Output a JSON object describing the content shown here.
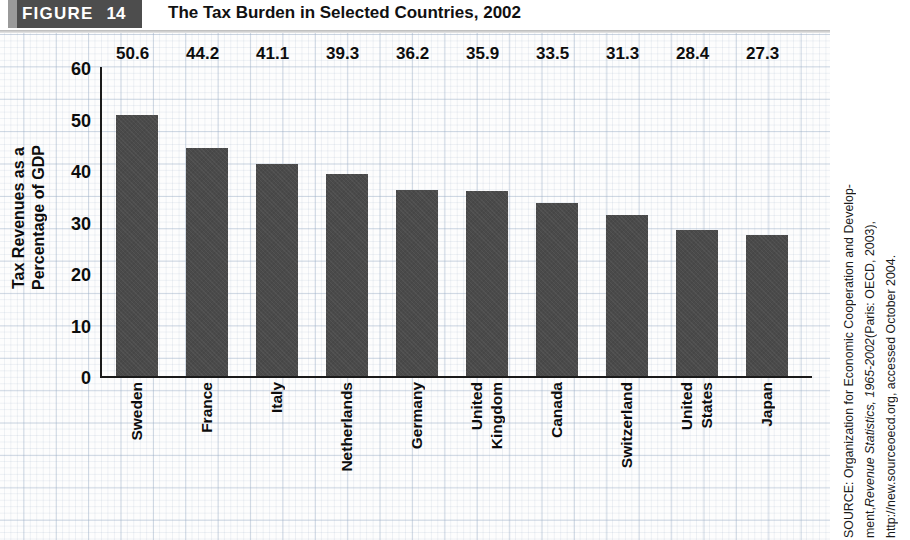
{
  "header": {
    "figure_word": "FIGURE",
    "figure_number": "14",
    "title": "The Tax Burden in Selected Countries, 2002"
  },
  "chart_data": {
    "type": "bar",
    "title": "The Tax Burden in Selected Countries, 2002",
    "xlabel": "",
    "ylabel": "Tax Revenues as a Percentage of GDP",
    "ylabel_lines": [
      "Tax Revenues as a",
      "Percentage of GDP"
    ],
    "ylim": [
      0,
      60
    ],
    "yticks": [
      "60",
      "50",
      "40",
      "30",
      "20",
      "10",
      "0"
    ],
    "ytick_values": [
      60,
      50,
      40,
      30,
      20,
      10,
      0
    ],
    "grid": true,
    "legend": "none",
    "bar_color": "#4a4a4a",
    "categories": [
      "Sweden",
      "France",
      "Italy",
      "Netherlands",
      "Germany",
      "United Kingdom",
      "Canada",
      "Switzerland",
      "United States",
      "Japan"
    ],
    "category_label_lines": [
      [
        "Sweden"
      ],
      [
        "France"
      ],
      [
        "Italy"
      ],
      [
        "Netherlands"
      ],
      [
        "Germany"
      ],
      [
        "United",
        "Kingdom"
      ],
      [
        "Canada"
      ],
      [
        "Switzerland"
      ],
      [
        "United",
        "States"
      ],
      [
        "Japan"
      ]
    ],
    "values": [
      50.6,
      44.2,
      41.1,
      39.3,
      36.2,
      35.9,
      33.5,
      31.3,
      28.4,
      27.3
    ],
    "value_labels": [
      "50.6",
      "44.2",
      "41.1",
      "39.3",
      "36.2",
      "35.9",
      "33.5",
      "31.3",
      "28.4",
      "27.3"
    ]
  },
  "source": {
    "line1": "SOURCE: Organization for Economic Cooperation and Develop-",
    "line2_prefix": "ment, ",
    "line2_italic": "Revenue Statistics, 1965-2002",
    "line2_suffix": " (Paris: OECD, 2003),",
    "line3": "http://new.sourceoecd.org, accessed October 2004."
  }
}
